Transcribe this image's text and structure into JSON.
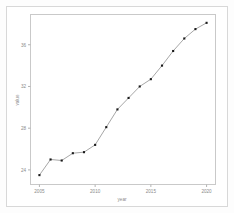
{
  "chart_data": {
    "type": "line",
    "title": "",
    "xlabel": "year",
    "ylabel": "value",
    "x": [
      2005,
      2006,
      2007,
      2008,
      2009,
      2010,
      2011,
      2012,
      2013,
      2014,
      2015,
      2016,
      2017,
      2018,
      2019,
      2020
    ],
    "values": [
      23.5,
      25.0,
      24.9,
      25.6,
      25.7,
      26.4,
      28.1,
      29.8,
      30.9,
      32.0,
      32.7,
      34.0,
      35.4,
      36.6,
      37.5,
      38.1
    ],
    "categories": [
      "2005",
      "2006",
      "2007",
      "2008",
      "2009",
      "2010",
      "2011",
      "2012",
      "2013",
      "2014",
      "2015",
      "2016",
      "2017",
      "2018",
      "2019",
      "2020"
    ],
    "series": [
      {
        "name": "value",
        "values": [
          23.5,
          25.0,
          24.9,
          25.6,
          25.7,
          26.4,
          28.1,
          29.8,
          30.9,
          32.0,
          32.7,
          34.0,
          35.4,
          36.6,
          37.5,
          38.1
        ]
      }
    ],
    "xticks": [
      2005,
      2010,
      2015,
      2020
    ],
    "xtick_labels": [
      "2005",
      "2010",
      "2015",
      "2020"
    ],
    "yticks": [
      24,
      28,
      32,
      36
    ],
    "ytick_labels": [
      "24",
      "28",
      "32",
      "36"
    ],
    "xlim": [
      2004.2,
      2020.8
    ],
    "ylim": [
      22.6,
      38.9
    ],
    "grid": false,
    "legend": false,
    "marker": "square",
    "colors": {
      "line": "#8f8f8f",
      "marker": "#1a1a1a",
      "axis": "#b3b3b3",
      "frame": "#c9c9c9",
      "tick_text": "#8a8a8a",
      "background": "#ffffff",
      "page_border": "#d8d8d8"
    }
  }
}
